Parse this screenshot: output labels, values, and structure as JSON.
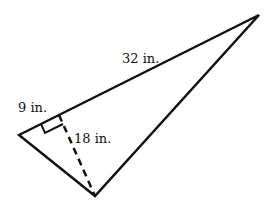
{
  "diagram": {
    "type": "triangle-with-altitude",
    "vertices": {
      "left": [
        19,
        135
      ],
      "top_right": [
        259,
        15
      ],
      "bottom": [
        95,
        196
      ]
    },
    "altitude_foot": [
      59,
      115
    ],
    "labels": {
      "long_side": "32 in.",
      "short_segment": "9 in.",
      "altitude": "18 in."
    },
    "colors": {
      "stroke": "#111111",
      "background": "#ffffff"
    }
  }
}
